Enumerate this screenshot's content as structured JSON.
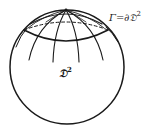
{
  "figure": {
    "type": "sphere-with-polar-cap",
    "stroke_color": "#1a1a1a",
    "background": "#ffffff"
  },
  "labels": {
    "boundary": {
      "text": "Γ=∂𝔇",
      "superscript": "2"
    },
    "disk": {
      "text": "𝔇",
      "superscript": "2"
    }
  }
}
